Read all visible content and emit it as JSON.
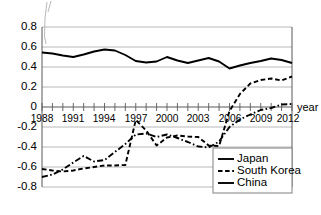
{
  "chart_data": {
    "type": "line",
    "title": "",
    "xlabel": "year",
    "ylabel": "",
    "xlim": [
      1988,
      2012
    ],
    "ylim": [
      -0.8,
      0.8
    ],
    "grid": true,
    "legend_position": "bottom-right",
    "x": [
      1988,
      1989,
      1990,
      1991,
      1992,
      1993,
      1994,
      1995,
      1996,
      1997,
      1998,
      1999,
      2000,
      2001,
      2002,
      2003,
      2004,
      2005,
      2006,
      2007,
      2008,
      2009,
      2010,
      2011,
      2012
    ],
    "xtick_labels": [
      "1988",
      "1991",
      "1994",
      "1997",
      "2000",
      "2003",
      "2006",
      "2009",
      "2012"
    ],
    "xtick_values": [
      1988,
      1991,
      1994,
      1997,
      2000,
      2003,
      2006,
      2009,
      2012
    ],
    "ytick_labels": [
      "0.8",
      "0.6",
      "0.4",
      "0.2",
      "0",
      "-0.2",
      "-0.4",
      "-0.6",
      "-0.8"
    ],
    "ytick_values": [
      0.8,
      0.6,
      0.4,
      0.2,
      0,
      -0.2,
      -0.4,
      -0.6,
      -0.8
    ],
    "series": [
      {
        "name": "Japan",
        "style": "solid",
        "values": [
          0.545,
          0.535,
          0.515,
          0.5,
          0.525,
          0.555,
          0.575,
          0.565,
          0.52,
          0.46,
          0.445,
          0.455,
          0.5,
          0.465,
          0.44,
          0.465,
          0.49,
          0.455,
          0.385,
          0.415,
          0.44,
          0.46,
          0.485,
          0.47,
          0.44
        ]
      },
      {
        "name": "South Korea",
        "style": "dashed",
        "values": [
          -0.62,
          -0.635,
          -0.645,
          -0.635,
          -0.615,
          -0.6,
          -0.585,
          -0.585,
          -0.58,
          -0.13,
          -0.235,
          -0.385,
          -0.305,
          -0.285,
          -0.295,
          -0.3,
          -0.385,
          -0.39,
          -0.04,
          0.13,
          0.235,
          0.27,
          0.285,
          0.265,
          0.305
        ]
      },
      {
        "name": "China",
        "style": "dash-dot",
        "values": [
          -0.7,
          -0.675,
          -0.625,
          -0.555,
          -0.49,
          -0.545,
          -0.53,
          -0.45,
          -0.37,
          -0.275,
          -0.265,
          -0.3,
          -0.275,
          -0.31,
          -0.35,
          -0.395,
          -0.405,
          -0.345,
          -0.2,
          -0.125,
          -0.075,
          -0.03,
          -0.01,
          0.025,
          0.03
        ]
      }
    ]
  },
  "legend": {
    "items": [
      {
        "label": "Japan",
        "style": "solid"
      },
      {
        "label": "South Korea",
        "style": "dashed"
      },
      {
        "label": "China",
        "style": "solid"
      }
    ]
  },
  "axis": {
    "x_axis_title": "year"
  }
}
